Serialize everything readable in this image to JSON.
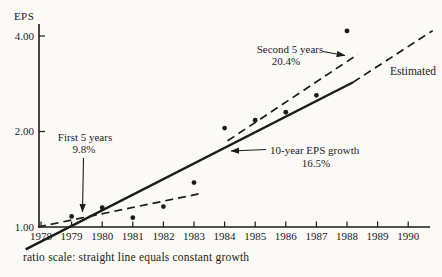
{
  "page": {
    "background": "#fbfaf7",
    "ink": "#1b1b1b"
  },
  "chart_data": {
    "type": "scatter",
    "title": "",
    "ylabel": "EPS",
    "y_scale": "log",
    "scale_note": "ratio scale: straight line equals constant growth",
    "x_tick_labels": [
      "1978",
      "1979",
      "1980",
      "1981",
      "1982",
      "1983",
      "1984",
      "1985",
      "1986",
      "1987",
      "1988",
      "1989",
      "1990"
    ],
    "xlim": [
      1978,
      1990
    ],
    "y_ticks": [
      {
        "label": "4.00",
        "value": 4.0
      },
      {
        "label": "2.00",
        "value": 2.0
      },
      {
        "label": "1.00",
        "value": 1.0
      }
    ],
    "ylim": [
      1.0,
      4.4
    ],
    "grid": false,
    "points": [
      {
        "year": 1979,
        "value": 1.08
      },
      {
        "year": 1980,
        "value": 1.15
      },
      {
        "year": 1981,
        "value": 1.07
      },
      {
        "year": 1982,
        "value": 1.16
      },
      {
        "year": 1983,
        "value": 1.38
      },
      {
        "year": 1984,
        "value": 2.05
      },
      {
        "year": 1985,
        "value": 2.17
      },
      {
        "year": 1986,
        "value": 2.3
      },
      {
        "year": 1987,
        "value": 2.6
      },
      {
        "year": 1988,
        "value": 4.15
      }
    ],
    "trend_lines": [
      {
        "name": "ten-year-eps-growth",
        "label": "10-year EPS growth",
        "rate": "16.5%",
        "style": "solid",
        "from": {
          "year": 1977.5,
          "value": 0.85
        },
        "to": {
          "year": 1988.2,
          "value": 2.86
        }
      },
      {
        "name": "first-5-years",
        "label": "First 5 years",
        "rate": "9.8%",
        "style": "dashed",
        "from": {
          "year": 1977.9,
          "value": 1.0
        },
        "to": {
          "year": 1983.3,
          "value": 1.28
        }
      },
      {
        "name": "second-5-years",
        "label": "Second 5 years",
        "rate": "20.4%",
        "style": "dashed",
        "from": {
          "year": 1984.1,
          "value": 1.87
        },
        "to": {
          "year": 1988.35,
          "value": 3.5
        }
      },
      {
        "name": "estimated",
        "label": "Estimated",
        "rate": "",
        "style": "dashed",
        "from": {
          "year": 1988.2,
          "value": 2.86
        },
        "to": {
          "year": 1990.8,
          "value": 4.16
        }
      }
    ],
    "annotations": {
      "first5": {
        "line1": "First 5 years",
        "line2": "9.8%"
      },
      "second5": {
        "line1": "Second 5 years",
        "line2": "20.4%"
      },
      "tenyear": {
        "line1": "10-year EPS growth",
        "line2": "16.5%"
      },
      "estimated": {
        "label": "Estimated"
      }
    }
  }
}
